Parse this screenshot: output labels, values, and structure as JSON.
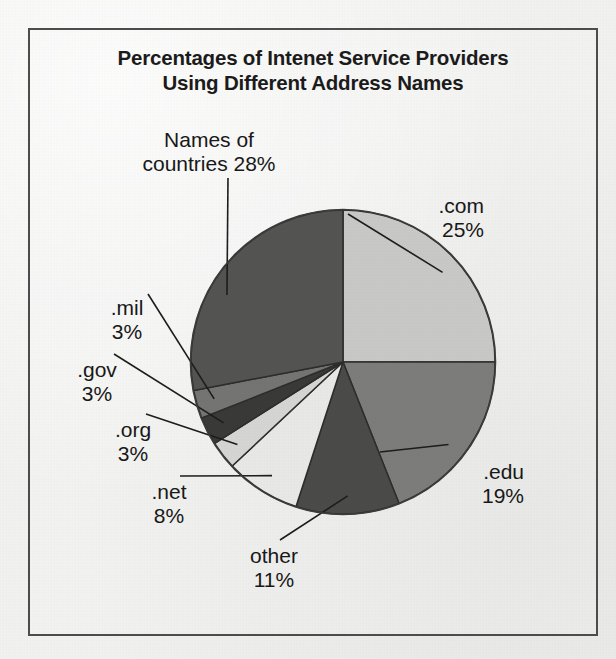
{
  "figure": {
    "title": "Percentages of Intenet Service Providers\nUsing Different Address Names",
    "frame_color": "#4d4d4d",
    "background_color": "#f2f2f0"
  },
  "chart_data": {
    "type": "pie",
    "title": "Percentages of Intenet Service Providers Using Different Address Names",
    "xlabel": "",
    "ylabel": "",
    "units": "percent",
    "total": 100,
    "legend": "none (direct labels with leader lines)",
    "grid": false,
    "start_angle_deg": 0,
    "direction": "clockwise",
    "categories": [
      ".com",
      ".edu",
      "other",
      ".net",
      ".org",
      ".gov",
      ".mil",
      "Names of countries"
    ],
    "values": [
      25,
      19,
      11,
      8,
      3,
      3,
      3,
      28
    ],
    "slices": [
      {
        "name": ".com",
        "label": ".com",
        "percent": 25,
        "percent_text": "25%",
        "label_text": ".com\n25%",
        "color": "#c9c9c7",
        "start_deg": 0,
        "end_deg": 90
      },
      {
        "name": ".edu",
        "label": ".edu",
        "percent": 19,
        "percent_text": "19%",
        "label_text": ".edu\n19%",
        "color": "#7d7d7b",
        "start_deg": 90,
        "end_deg": 158.4
      },
      {
        "name": "other",
        "label": "other",
        "percent": 11,
        "percent_text": "11%",
        "label_text": "other\n11%",
        "color": "#4b4b4a",
        "start_deg": 158.4,
        "end_deg": 198
      },
      {
        "name": ".net",
        "label": ".net",
        "percent": 8,
        "percent_text": "8%",
        "label_text": ".net\n8%",
        "color": "#e9e9e7",
        "start_deg": 198,
        "end_deg": 226.8
      },
      {
        "name": ".org",
        "label": ".org",
        "percent": 3,
        "percent_text": "3%",
        "label_text": ".org\n3%",
        "color": "#d6d6d4",
        "start_deg": 226.8,
        "end_deg": 237.6
      },
      {
        "name": ".gov",
        "label": ".gov",
        "percent": 3,
        "percent_text": "3%",
        "label_text": ".gov\n3%",
        "color": "#3a3a39",
        "start_deg": 237.6,
        "end_deg": 248.4
      },
      {
        "name": ".mil",
        "label": ".mil",
        "percent": 3,
        "percent_text": "3%",
        "label_text": ".mil\n3%",
        "color": "#757573",
        "start_deg": 248.4,
        "end_deg": 259.2
      },
      {
        "name": "Names of countries",
        "label": "Names of countries",
        "percent": 28,
        "percent_text": "28%",
        "label_text": "Names of\ncountries 28%",
        "color": "#545453",
        "start_deg": 259.2,
        "end_deg": 360
      }
    ]
  }
}
